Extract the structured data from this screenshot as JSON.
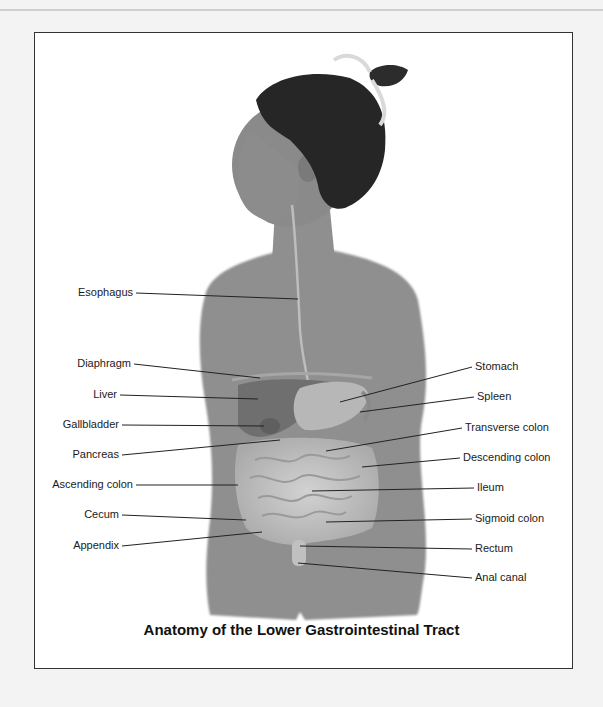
{
  "figure": {
    "title": "Anatomy of the Lower Gastrointestinal Tract"
  },
  "labels_left": [
    {
      "text": "Esophagus",
      "x": 136,
      "y": 293,
      "tx": 298,
      "ty": 299
    },
    {
      "text": "Diaphragm",
      "x": 134,
      "y": 364,
      "tx": 260,
      "ty": 378
    },
    {
      "text": "Liver",
      "x": 120,
      "y": 395,
      "tx": 258,
      "ty": 399
    },
    {
      "text": "Gallbladder",
      "x": 122,
      "y": 425,
      "tx": 264,
      "ty": 426
    },
    {
      "text": "Pancreas",
      "x": 122,
      "y": 455,
      "tx": 280,
      "ty": 440
    },
    {
      "text": "Ascending colon",
      "x": 136,
      "y": 485,
      "tx": 238,
      "ty": 485
    },
    {
      "text": "Cecum",
      "x": 122,
      "y": 515,
      "tx": 246,
      "ty": 520
    },
    {
      "text": "Appendix",
      "x": 122,
      "y": 546,
      "tx": 262,
      "ty": 532
    }
  ],
  "labels_right": [
    {
      "text": "Stomach",
      "x": 472,
      "y": 367,
      "tx": 340,
      "ty": 402
    },
    {
      "text": "Spleen",
      "x": 474,
      "y": 397,
      "tx": 360,
      "ty": 412
    },
    {
      "text": "Transverse colon",
      "x": 462,
      "y": 428,
      "tx": 326,
      "ty": 451
    },
    {
      "text": "Descending colon",
      "x": 460,
      "y": 458,
      "tx": 362,
      "ty": 467
    },
    {
      "text": "Ileum",
      "x": 474,
      "y": 488,
      "tx": 312,
      "ty": 491
    },
    {
      "text": "Sigmoid colon",
      "x": 472,
      "y": 519,
      "tx": 326,
      "ty": 522
    },
    {
      "text": "Rectum",
      "x": 472,
      "y": 549,
      "tx": 300,
      "ty": 546
    },
    {
      "text": "Anal canal",
      "x": 472,
      "y": 578,
      "tx": 298,
      "ty": 563
    }
  ],
  "colors": {
    "skin": "#8c8c8c",
    "hair": "#2a2a2a",
    "organ": "#a8a8a8",
    "intestine": "#c4c4c4",
    "leader": "#222222",
    "frame": "#333333"
  }
}
